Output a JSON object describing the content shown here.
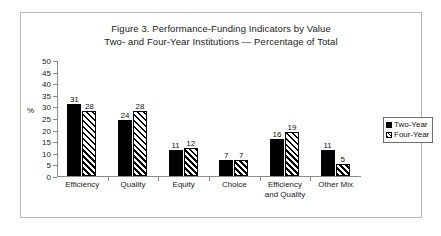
{
  "figure": {
    "title_line1": "Figure 3. Performance-Funding Indicators by Value",
    "title_line2": "Two- and Four-Year Institutions — Percentage of Total",
    "border_color": "#b8b8b8",
    "background": "#ffffff"
  },
  "legend": {
    "position": "right-inside",
    "items": [
      {
        "label": "Two-Year",
        "swatch": "solid-black-square-icon",
        "color": "#000000"
      },
      {
        "label": "Four-Year",
        "swatch": "diagonal-hatch-square-icon",
        "color": "#000000"
      }
    ]
  },
  "axes": {
    "y_unit_label": "%",
    "y_ticks": [
      "0",
      "5",
      "10",
      "15",
      "20",
      "25",
      "30",
      "35",
      "40",
      "45",
      "50"
    ],
    "x_categories": [
      {
        "line1": "Efficiency",
        "line2": ""
      },
      {
        "line1": "Quality",
        "line2": ""
      },
      {
        "line1": "Equity",
        "line2": ""
      },
      {
        "line1": "Choice",
        "line2": ""
      },
      {
        "line1": "Efficiency",
        "line2": "and Quality"
      },
      {
        "line1": "Other Mix",
        "line2": ""
      }
    ]
  },
  "chart_data": {
    "type": "bar",
    "xlabel": "",
    "ylabel": "%",
    "ylim": [
      0,
      50
    ],
    "ytick_step": 5,
    "grid": false,
    "legend_position": "right",
    "categories": [
      "Efficiency",
      "Quality",
      "Equity",
      "Choice",
      "Efficiency and Quality",
      "Other Mix"
    ],
    "series": [
      {
        "name": "Two-Year",
        "values": [
          31,
          24,
          11,
          7,
          16,
          11
        ]
      },
      {
        "name": "Four-Year",
        "values": [
          28,
          28,
          12,
          7,
          19,
          5
        ]
      }
    ]
  }
}
